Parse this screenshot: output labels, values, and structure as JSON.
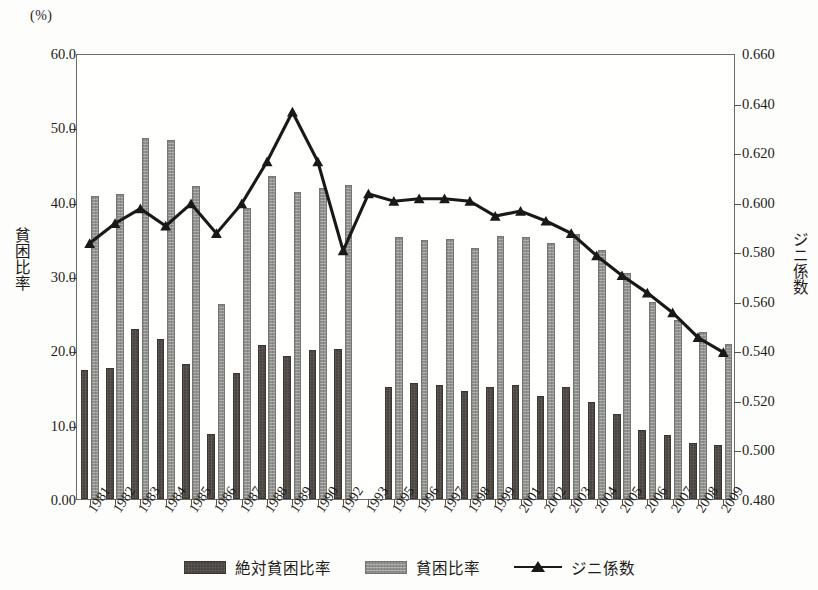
{
  "chart_data": {
    "type": "bar",
    "title": "",
    "unit_caption": "(%)",
    "xlabel": "",
    "ylabel": "貧困比率",
    "ylabel_secondary": "ジニ係数",
    "grid": false,
    "legend_position": "bottom",
    "categories": [
      "1981",
      "1982",
      "1983",
      "1984",
      "1985",
      "1986",
      "1987",
      "1988",
      "1989",
      "1990",
      "1992",
      "1993",
      "1995",
      "1996",
      "1997",
      "1998",
      "1999",
      "2001",
      "2002",
      "2003",
      "2004",
      "2005",
      "2006",
      "2007",
      "2008",
      "2009"
    ],
    "ylim": [
      0.0,
      60.0
    ],
    "yticks": [
      "0.00",
      "10.0",
      "20.0",
      "30.0",
      "40.0",
      "50.0",
      "60.0"
    ],
    "ylim_secondary": [
      0.48,
      0.66
    ],
    "yticks_secondary": [
      "0.480",
      "0.500",
      "0.520",
      "0.540",
      "0.560",
      "0.580",
      "0.600",
      "0.620",
      "0.640",
      "0.660"
    ],
    "series": [
      {
        "name": "絶対貧困比率",
        "kind": "bar",
        "axis": "left",
        "color": "#4b4541",
        "values": [
          17.4,
          17.6,
          22.9,
          21.5,
          18.1,
          8.8,
          17.0,
          20.7,
          19.2,
          20.0,
          20.2,
          null,
          15.1,
          15.6,
          15.3,
          14.5,
          15.1,
          15.4,
          13.9,
          15.1,
          13.1,
          11.5,
          9.3,
          8.6,
          7.6,
          7.3
        ]
      },
      {
        "name": "貧困比率",
        "kind": "bar",
        "axis": "left",
        "color": "#919290",
        "values": [
          40.7,
          41.0,
          48.6,
          48.3,
          42.1,
          26.2,
          39.1,
          43.4,
          41.3,
          41.8,
          42.2,
          null,
          35.3,
          34.9,
          35.0,
          33.8,
          35.4,
          35.3,
          34.4,
          35.7,
          33.5,
          30.4,
          26.5,
          24.1,
          22.5,
          20.9
        ]
      },
      {
        "name": "ジニ係数",
        "kind": "line",
        "axis": "right",
        "color": "#1a1916",
        "marker": "triangle",
        "values": [
          0.584,
          0.592,
          0.598,
          0.591,
          0.6,
          0.588,
          0.6,
          0.617,
          0.637,
          0.617,
          0.581,
          0.604,
          0.601,
          0.602,
          0.602,
          0.601,
          0.595,
          0.597,
          0.593,
          0.588,
          0.579,
          0.571,
          0.564,
          0.556,
          0.546,
          0.54
        ]
      }
    ],
    "note_missing_years": [
      "1991",
      "1994",
      "2000"
    ]
  },
  "legend": {
    "items": [
      {
        "label": "絶対貧困比率",
        "style": "bar-dark"
      },
      {
        "label": "貧困比率",
        "style": "bar-light"
      },
      {
        "label": "ジニ係数",
        "style": "line-triangle"
      }
    ]
  }
}
